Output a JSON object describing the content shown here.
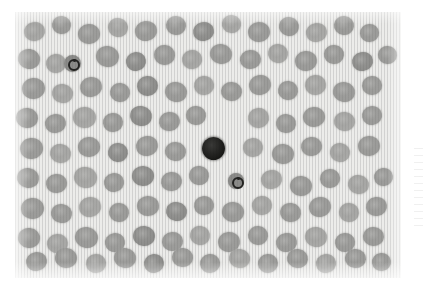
{
  "figure": {
    "kind": "light-microscopy-photomicrograph",
    "modality": "brightfield, Romanowsky-type stain, reproduced in grayscale",
    "caption": "",
    "panel": {
      "left": 15,
      "top": 12,
      "width": 386,
      "height": 266,
      "background_color": "#ececea",
      "has_vertical_scan_lines": true
    },
    "margin": {
      "color": "#ffffff",
      "artifact_present": true,
      "artifact_text": ""
    }
  },
  "palette": {
    "background": "#ececea",
    "erythrocyte_mid": "#9c9c9a",
    "erythrocyte_pale": "#a9a9a7",
    "erythrocyte_dark": "#8e8e8c",
    "leukocyte_nucleus": "#17171 5",
    "ring_outline": "#232321",
    "page_white": "#ffffff"
  },
  "features": {
    "erythrocyte_count_visible": 118,
    "leukocyte_count_visible": 1,
    "ring_form_count_visible": 2,
    "notes": ""
  },
  "objects": {
    "leukocyte": {
      "label": "dark-stained leukocyte",
      "center_x": 213,
      "center_y": 148,
      "diameter": 23
    },
    "ring_cells": [
      {
        "label": "ring-form cell lower",
        "center_x": 236,
        "center_y": 181,
        "diameter": 16,
        "ring_diameter": 8
      },
      {
        "label": "inclusion cell upper-left",
        "center_x": 72,
        "center_y": 63,
        "diameter": 17,
        "ring_diameter": 8
      }
    ]
  },
  "erythrocytes": [
    {
      "x": 24,
      "y": 22,
      "w": 21,
      "h": 19,
      "r": -12,
      "tone": "pale"
    },
    {
      "x": 52,
      "y": 16,
      "w": 19,
      "h": 18,
      "r": 8,
      "tone": "mid"
    },
    {
      "x": 78,
      "y": 24,
      "w": 22,
      "h": 20,
      "r": -4,
      "tone": "mid"
    },
    {
      "x": 108,
      "y": 18,
      "w": 20,
      "h": 19,
      "r": 16,
      "tone": "pale"
    },
    {
      "x": 135,
      "y": 21,
      "w": 22,
      "h": 20,
      "r": -9,
      "tone": "mid"
    },
    {
      "x": 166,
      "y": 16,
      "w": 20,
      "h": 19,
      "r": 5,
      "tone": "mid"
    },
    {
      "x": 193,
      "y": 22,
      "w": 21,
      "h": 19,
      "r": -14,
      "tone": "dark"
    },
    {
      "x": 222,
      "y": 15,
      "w": 19,
      "h": 18,
      "r": 11,
      "tone": "pale"
    },
    {
      "x": 248,
      "y": 22,
      "w": 22,
      "h": 20,
      "r": -6,
      "tone": "mid"
    },
    {
      "x": 279,
      "y": 17,
      "w": 20,
      "h": 19,
      "r": 14,
      "tone": "mid"
    },
    {
      "x": 306,
      "y": 23,
      "w": 21,
      "h": 19,
      "r": -10,
      "tone": "pale"
    },
    {
      "x": 334,
      "y": 16,
      "w": 20,
      "h": 19,
      "r": 7,
      "tone": "mid"
    },
    {
      "x": 360,
      "y": 24,
      "w": 19,
      "h": 18,
      "r": -3,
      "tone": "mid"
    },
    {
      "x": 18,
      "y": 49,
      "w": 22,
      "h": 20,
      "r": 9,
      "tone": "mid"
    },
    {
      "x": 46,
      "y": 54,
      "w": 20,
      "h": 19,
      "r": -7,
      "tone": "pale"
    },
    {
      "x": 96,
      "y": 46,
      "w": 23,
      "h": 21,
      "r": 13,
      "tone": "mid"
    },
    {
      "x": 126,
      "y": 52,
      "w": 20,
      "h": 19,
      "r": -11,
      "tone": "dark"
    },
    {
      "x": 154,
      "y": 45,
      "w": 21,
      "h": 20,
      "r": 4,
      "tone": "mid"
    },
    {
      "x": 182,
      "y": 50,
      "w": 20,
      "h": 19,
      "r": -15,
      "tone": "pale"
    },
    {
      "x": 210,
      "y": 44,
      "w": 22,
      "h": 20,
      "r": 10,
      "tone": "mid"
    },
    {
      "x": 240,
      "y": 50,
      "w": 21,
      "h": 19,
      "r": -5,
      "tone": "mid"
    },
    {
      "x": 268,
      "y": 44,
      "w": 20,
      "h": 19,
      "r": 12,
      "tone": "pale"
    },
    {
      "x": 295,
      "y": 51,
      "w": 22,
      "h": 20,
      "r": -8,
      "tone": "mid"
    },
    {
      "x": 324,
      "y": 45,
      "w": 20,
      "h": 19,
      "r": 6,
      "tone": "mid"
    },
    {
      "x": 352,
      "y": 52,
      "w": 21,
      "h": 19,
      "r": -13,
      "tone": "dark"
    },
    {
      "x": 378,
      "y": 46,
      "w": 19,
      "h": 18,
      "r": 3,
      "tone": "mid"
    },
    {
      "x": 22,
      "y": 78,
      "w": 23,
      "h": 21,
      "r": -6,
      "tone": "mid"
    },
    {
      "x": 52,
      "y": 84,
      "w": 21,
      "h": 19,
      "r": 11,
      "tone": "pale"
    },
    {
      "x": 80,
      "y": 77,
      "w": 22,
      "h": 20,
      "r": -12,
      "tone": "mid"
    },
    {
      "x": 110,
      "y": 83,
      "w": 20,
      "h": 19,
      "r": 7,
      "tone": "mid"
    },
    {
      "x": 137,
      "y": 76,
      "w": 21,
      "h": 20,
      "r": -4,
      "tone": "dark"
    },
    {
      "x": 165,
      "y": 82,
      "w": 22,
      "h": 20,
      "r": 14,
      "tone": "mid"
    },
    {
      "x": 194,
      "y": 76,
      "w": 20,
      "h": 19,
      "r": -9,
      "tone": "pale"
    },
    {
      "x": 221,
      "y": 82,
      "w": 21,
      "h": 19,
      "r": 5,
      "tone": "mid"
    },
    {
      "x": 249,
      "y": 75,
      "w": 22,
      "h": 20,
      "r": -14,
      "tone": "mid"
    },
    {
      "x": 278,
      "y": 81,
      "w": 20,
      "h": 19,
      "r": 9,
      "tone": "mid"
    },
    {
      "x": 305,
      "y": 75,
      "w": 21,
      "h": 20,
      "r": -7,
      "tone": "pale"
    },
    {
      "x": 333,
      "y": 82,
      "w": 22,
      "h": 20,
      "r": 12,
      "tone": "mid"
    },
    {
      "x": 362,
      "y": 76,
      "w": 20,
      "h": 19,
      "r": -3,
      "tone": "mid"
    },
    {
      "x": 16,
      "y": 108,
      "w": 22,
      "h": 20,
      "r": 8,
      "tone": "mid"
    },
    {
      "x": 45,
      "y": 114,
      "w": 21,
      "h": 19,
      "r": -11,
      "tone": "mid"
    },
    {
      "x": 73,
      "y": 107,
      "w": 23,
      "h": 21,
      "r": 4,
      "tone": "pale"
    },
    {
      "x": 103,
      "y": 113,
      "w": 20,
      "h": 19,
      "r": -6,
      "tone": "mid"
    },
    {
      "x": 130,
      "y": 106,
      "w": 22,
      "h": 20,
      "r": 13,
      "tone": "dark"
    },
    {
      "x": 159,
      "y": 112,
      "w": 21,
      "h": 19,
      "r": -9,
      "tone": "mid"
    },
    {
      "x": 186,
      "y": 106,
      "w": 20,
      "h": 19,
      "r": 6,
      "tone": "mid"
    },
    {
      "x": 248,
      "y": 108,
      "w": 21,
      "h": 20,
      "r": -13,
      "tone": "pale"
    },
    {
      "x": 276,
      "y": 114,
      "w": 20,
      "h": 19,
      "r": 10,
      "tone": "mid"
    },
    {
      "x": 303,
      "y": 107,
      "w": 22,
      "h": 20,
      "r": -5,
      "tone": "mid"
    },
    {
      "x": 334,
      "y": 112,
      "w": 21,
      "h": 19,
      "r": 7,
      "tone": "pale"
    },
    {
      "x": 362,
      "y": 106,
      "w": 20,
      "h": 19,
      "r": -12,
      "tone": "mid"
    },
    {
      "x": 20,
      "y": 138,
      "w": 23,
      "h": 21,
      "r": -8,
      "tone": "mid"
    },
    {
      "x": 50,
      "y": 144,
      "w": 21,
      "h": 19,
      "r": 12,
      "tone": "pale"
    },
    {
      "x": 78,
      "y": 137,
      "w": 22,
      "h": 20,
      "r": -4,
      "tone": "mid"
    },
    {
      "x": 108,
      "y": 143,
      "w": 20,
      "h": 19,
      "r": 9,
      "tone": "dark"
    },
    {
      "x": 136,
      "y": 136,
      "w": 22,
      "h": 20,
      "r": -14,
      "tone": "mid"
    },
    {
      "x": 165,
      "y": 142,
      "w": 21,
      "h": 19,
      "r": 5,
      "tone": "mid"
    },
    {
      "x": 243,
      "y": 138,
      "w": 20,
      "h": 19,
      "r": -10,
      "tone": "pale"
    },
    {
      "x": 272,
      "y": 144,
      "w": 22,
      "h": 20,
      "r": 6,
      "tone": "mid"
    },
    {
      "x": 301,
      "y": 137,
      "w": 21,
      "h": 19,
      "r": -7,
      "tone": "mid"
    },
    {
      "x": 330,
      "y": 143,
      "w": 20,
      "h": 19,
      "r": 11,
      "tone": "pale"
    },
    {
      "x": 358,
      "y": 136,
      "w": 22,
      "h": 20,
      "r": -5,
      "tone": "mid"
    },
    {
      "x": 17,
      "y": 168,
      "w": 22,
      "h": 20,
      "r": 10,
      "tone": "mid"
    },
    {
      "x": 46,
      "y": 174,
      "w": 21,
      "h": 19,
      "r": -6,
      "tone": "mid"
    },
    {
      "x": 74,
      "y": 167,
      "w": 23,
      "h": 21,
      "r": 14,
      "tone": "pale"
    },
    {
      "x": 104,
      "y": 173,
      "w": 20,
      "h": 19,
      "r": -11,
      "tone": "mid"
    },
    {
      "x": 132,
      "y": 166,
      "w": 22,
      "h": 20,
      "r": 3,
      "tone": "dark"
    },
    {
      "x": 161,
      "y": 172,
      "w": 21,
      "h": 19,
      "r": -9,
      "tone": "mid"
    },
    {
      "x": 189,
      "y": 166,
      "w": 20,
      "h": 19,
      "r": 8,
      "tone": "mid"
    },
    {
      "x": 261,
      "y": 170,
      "w": 21,
      "h": 19,
      "r": -13,
      "tone": "pale"
    },
    {
      "x": 290,
      "y": 176,
      "w": 22,
      "h": 20,
      "r": 6,
      "tone": "mid"
    },
    {
      "x": 320,
      "y": 169,
      "w": 20,
      "h": 19,
      "r": -4,
      "tone": "mid"
    },
    {
      "x": 348,
      "y": 175,
      "w": 21,
      "h": 19,
      "r": 12,
      "tone": "pale"
    },
    {
      "x": 374,
      "y": 168,
      "w": 19,
      "h": 18,
      "r": -8,
      "tone": "mid"
    },
    {
      "x": 21,
      "y": 198,
      "w": 23,
      "h": 21,
      "r": -7,
      "tone": "mid"
    },
    {
      "x": 51,
      "y": 204,
      "w": 21,
      "h": 19,
      "r": 11,
      "tone": "mid"
    },
    {
      "x": 79,
      "y": 197,
      "w": 22,
      "h": 20,
      "r": -12,
      "tone": "pale"
    },
    {
      "x": 109,
      "y": 203,
      "w": 20,
      "h": 19,
      "r": 5,
      "tone": "mid"
    },
    {
      "x": 137,
      "y": 196,
      "w": 22,
      "h": 20,
      "r": -3,
      "tone": "mid"
    },
    {
      "x": 166,
      "y": 202,
      "w": 21,
      "h": 19,
      "r": 13,
      "tone": "dark"
    },
    {
      "x": 194,
      "y": 196,
      "w": 20,
      "h": 19,
      "r": -10,
      "tone": "mid"
    },
    {
      "x": 222,
      "y": 202,
      "w": 22,
      "h": 20,
      "r": 7,
      "tone": "mid"
    },
    {
      "x": 252,
      "y": 196,
      "w": 20,
      "h": 19,
      "r": -6,
      "tone": "pale"
    },
    {
      "x": 280,
      "y": 203,
      "w": 21,
      "h": 19,
      "r": 9,
      "tone": "mid"
    },
    {
      "x": 309,
      "y": 197,
      "w": 22,
      "h": 20,
      "r": -14,
      "tone": "mid"
    },
    {
      "x": 339,
      "y": 203,
      "w": 20,
      "h": 19,
      "r": 4,
      "tone": "pale"
    },
    {
      "x": 366,
      "y": 197,
      "w": 21,
      "h": 19,
      "r": -9,
      "tone": "mid"
    },
    {
      "x": 18,
      "y": 228,
      "w": 22,
      "h": 20,
      "r": 8,
      "tone": "mid"
    },
    {
      "x": 47,
      "y": 234,
      "w": 21,
      "h": 19,
      "r": -5,
      "tone": "pale"
    },
    {
      "x": 75,
      "y": 227,
      "w": 23,
      "h": 21,
      "r": 12,
      "tone": "mid"
    },
    {
      "x": 105,
      "y": 233,
      "w": 20,
      "h": 19,
      "r": -11,
      "tone": "mid"
    },
    {
      "x": 133,
      "y": 226,
      "w": 22,
      "h": 20,
      "r": 6,
      "tone": "dark"
    },
    {
      "x": 162,
      "y": 232,
      "w": 21,
      "h": 19,
      "r": -4,
      "tone": "mid"
    },
    {
      "x": 190,
      "y": 226,
      "w": 20,
      "h": 19,
      "r": 14,
      "tone": "pale"
    },
    {
      "x": 218,
      "y": 232,
      "w": 22,
      "h": 20,
      "r": -8,
      "tone": "mid"
    },
    {
      "x": 248,
      "y": 226,
      "w": 20,
      "h": 19,
      "r": 5,
      "tone": "mid"
    },
    {
      "x": 276,
      "y": 233,
      "w": 21,
      "h": 19,
      "r": -13,
      "tone": "mid"
    },
    {
      "x": 305,
      "y": 227,
      "w": 22,
      "h": 20,
      "r": 9,
      "tone": "pale"
    },
    {
      "x": 335,
      "y": 233,
      "w": 20,
      "h": 19,
      "r": -6,
      "tone": "mid"
    },
    {
      "x": 363,
      "y": 227,
      "w": 21,
      "h": 19,
      "r": 3,
      "tone": "mid"
    },
    {
      "x": 26,
      "y": 252,
      "w": 21,
      "h": 19,
      "r": -10,
      "tone": "mid"
    },
    {
      "x": 55,
      "y": 248,
      "w": 22,
      "h": 20,
      "r": 7,
      "tone": "mid"
    },
    {
      "x": 86,
      "y": 254,
      "w": 20,
      "h": 19,
      "r": -4,
      "tone": "pale"
    },
    {
      "x": 114,
      "y": 248,
      "w": 22,
      "h": 20,
      "r": 11,
      "tone": "mid"
    },
    {
      "x": 144,
      "y": 254,
      "w": 20,
      "h": 19,
      "r": -12,
      "tone": "dark"
    },
    {
      "x": 172,
      "y": 248,
      "w": 21,
      "h": 19,
      "r": 6,
      "tone": "mid"
    },
    {
      "x": 200,
      "y": 254,
      "w": 20,
      "h": 19,
      "r": -7,
      "tone": "mid"
    },
    {
      "x": 229,
      "y": 249,
      "w": 21,
      "h": 19,
      "r": 13,
      "tone": "pale"
    },
    {
      "x": 258,
      "y": 254,
      "w": 20,
      "h": 19,
      "r": -5,
      "tone": "mid"
    },
    {
      "x": 287,
      "y": 249,
      "w": 21,
      "h": 19,
      "r": 8,
      "tone": "mid"
    },
    {
      "x": 316,
      "y": 254,
      "w": 20,
      "h": 19,
      "r": -11,
      "tone": "pale"
    },
    {
      "x": 345,
      "y": 249,
      "w": 21,
      "h": 19,
      "r": 4,
      "tone": "mid"
    },
    {
      "x": 372,
      "y": 253,
      "w": 19,
      "h": 18,
      "r": -9,
      "tone": "mid"
    }
  ]
}
